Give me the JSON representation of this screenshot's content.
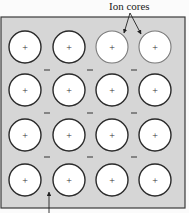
{
  "diagram": {
    "labels": {
      "ion_cores": "Ion cores"
    },
    "colors": {
      "page_background": "#fbfbfb",
      "box_fill": "#d6d6d6",
      "box_stroke": "#3a3a3a",
      "ion_fill": "#ffffff",
      "ion_stroke": "#2a2a2a",
      "ion_stroke_light": "#7a7a7a",
      "sign_color": "#333333",
      "arrow_color": "#222222"
    },
    "box": {
      "x": 1,
      "y": 17,
      "width": 184,
      "height": 191
    },
    "ion_grid": {
      "rows": 4,
      "cols": 4,
      "col_centers": [
        25,
        69,
        112,
        155
      ],
      "row_centers": [
        47,
        90,
        135,
        180
      ],
      "radius": 16,
      "charge_symbol": "+"
    },
    "electrons": {
      "symbol": "−",
      "row_positions_y": [
        70,
        113,
        157
      ],
      "col_positions_x": [
        47,
        90,
        134
      ]
    },
    "annotations": [
      {
        "name": "ion-cores-label",
        "text_key": "ion_cores",
        "text_x": 133,
        "text_y": 7,
        "arrow_origin": [
          130,
          13
        ],
        "arrow_targets": [
          [
            124,
            33
          ],
          [
            141,
            34
          ]
        ]
      },
      {
        "name": "electron-sea-pointer",
        "arrow_origin": [
          49,
          213
        ],
        "arrow_target": [
          49,
          192
        ]
      }
    ]
  }
}
